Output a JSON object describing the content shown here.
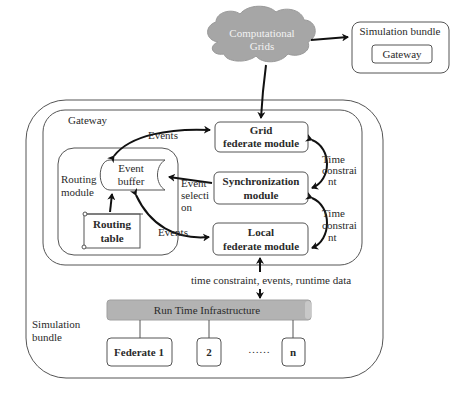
{
  "cloud": {
    "line1": "Computational",
    "line2": "Grids",
    "color": "#a6a6a6"
  },
  "top_bundle": {
    "title": "Simulation bundle",
    "inner": "Gateway"
  },
  "outer_bundle": {
    "label_line1": "Simulation",
    "label_line2": "bundle"
  },
  "gateway": {
    "label": "Gateway"
  },
  "routing_module": {
    "label_line1": "Routing",
    "label_line2": "module"
  },
  "event_buffer": {
    "line1": "Event",
    "line2": "buffer"
  },
  "routing_table": {
    "line1": "Routing",
    "line2": "table"
  },
  "modules": {
    "grid": {
      "line1": "Grid",
      "line2": "federate module"
    },
    "sync": {
      "line1": "Synchronization",
      "line2": "module"
    },
    "local": {
      "line1": "Local",
      "line2": "federate module"
    }
  },
  "edge_labels": {
    "events_top": "Events",
    "events_bottom": "Events",
    "event_selection": [
      "Event",
      "selecti",
      "on"
    ],
    "time_constraint_1": [
      "Time",
      "constrai",
      "nt"
    ],
    "time_constraint_2": [
      "Time",
      "constrai",
      "nt"
    ],
    "rti_link": "time constraint, events, runtime data"
  },
  "rti": {
    "label": "Run Time Infrastructure",
    "color": "#b3b3b3"
  },
  "federates": {
    "f1": "Federate 1",
    "f2": "2",
    "dots": "……",
    "fn": "n"
  }
}
